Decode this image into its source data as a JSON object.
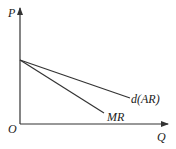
{
  "diagram": {
    "type": "economics-revenue-curves",
    "axes": {
      "y_label": "P",
      "x_label": "Q",
      "origin_label": "O"
    },
    "curves": [
      {
        "id": "demand",
        "label": "d(AR)",
        "description": "Demand / average revenue line, downward sloping from price-axis intercept"
      },
      {
        "id": "mr",
        "label": "MR",
        "description": "Marginal revenue line, steeper, same intercept as demand"
      }
    ],
    "colors": {
      "line": "#333333",
      "text": "#222222",
      "background": "#ffffff"
    }
  }
}
